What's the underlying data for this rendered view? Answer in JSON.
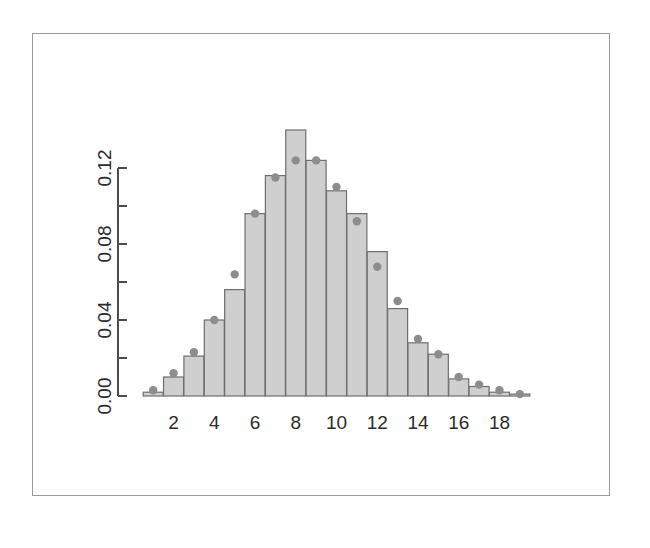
{
  "figure": {
    "width": 650,
    "height": 548,
    "background": "#ffffff",
    "frame_color": "#9a9a9a"
  },
  "style": {
    "bar_fill": "#cfcfcf",
    "bar_border": "#6e6e6e",
    "point_color": "#8d8d8d",
    "axis_color": "#4d4d4d",
    "text_color": "#2b2b2b"
  },
  "chart_data": {
    "type": "bar",
    "title": "",
    "subtitle": "",
    "xlabel": "",
    "ylabel": "",
    "legend": [],
    "legend_position": "none",
    "grid": false,
    "xlim": [
      0.5,
      19.5
    ],
    "ylim": [
      0.0,
      0.145
    ],
    "y_axis_range_drawn": [
      0.0,
      0.12
    ],
    "x_tick_labels": [
      "2",
      "4",
      "6",
      "8",
      "10",
      "12",
      "14",
      "16",
      "18"
    ],
    "x_tick_values": [
      2,
      4,
      6,
      8,
      10,
      12,
      14,
      16,
      18
    ],
    "y_tick_labels": [
      "0.00",
      "0.04",
      "0.08",
      "0.12"
    ],
    "y_tick_values": [
      0.0,
      0.04,
      0.08,
      0.12
    ],
    "y_minor_tick_values": [
      0.02,
      0.06,
      0.1
    ],
    "categories": [
      1,
      2,
      3,
      4,
      5,
      6,
      7,
      8,
      9,
      10,
      11,
      12,
      13,
      14,
      15,
      16,
      17,
      18,
      19
    ],
    "series": [
      {
        "name": "observed-frequency",
        "render": "bar",
        "values": [
          0.002,
          0.01,
          0.021,
          0.04,
          0.056,
          0.096,
          0.116,
          0.14,
          0.124,
          0.108,
          0.096,
          0.076,
          0.046,
          0.028,
          0.022,
          0.009,
          0.005,
          0.002,
          0.001
        ]
      },
      {
        "name": "expected-probability",
        "render": "point",
        "values": [
          0.003,
          0.012,
          0.023,
          0.04,
          0.064,
          0.096,
          0.115,
          0.124,
          0.124,
          0.11,
          0.092,
          0.068,
          0.05,
          0.03,
          0.022,
          0.01,
          0.006,
          0.003,
          0.001
        ]
      }
    ]
  },
  "geometry": {
    "plot_left": 143,
    "plot_right": 530,
    "baseline_y": 396,
    "y_top_tick_y": 168,
    "bar_width": 20,
    "bar_step": 21.5,
    "y_axis_x": 118,
    "point_radius": 4.2
  }
}
